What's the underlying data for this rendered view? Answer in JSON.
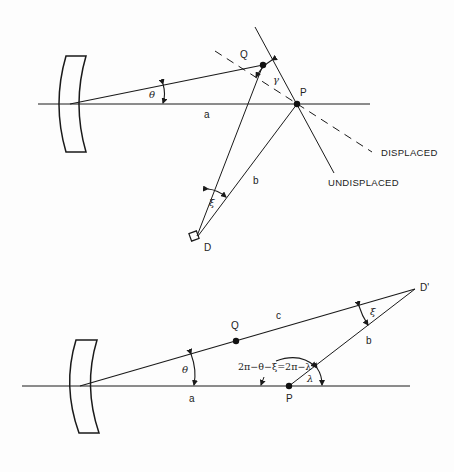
{
  "top_diagram": {
    "points": {
      "Q": "Q",
      "P": "P",
      "D": "D"
    },
    "segments": {
      "a": "a",
      "b": "b"
    },
    "angles": {
      "theta": "θ",
      "gamma": "γ",
      "xi": "ξ"
    },
    "line_labels": {
      "displaced": "DISPLACED",
      "undisplaced": "UNDISPLACED"
    }
  },
  "bottom_diagram": {
    "points": {
      "Q": "Q",
      "P": "P",
      "D_prime": "D'"
    },
    "segments": {
      "a": "a",
      "b": "b",
      "c": "c"
    },
    "angles": {
      "theta": "θ",
      "xi": "ξ",
      "lambda": "λ"
    },
    "formula": "2π−θ−ξ=2π−λ"
  },
  "colors": {
    "line": "#1a1a1a",
    "background": "#fdfdfd"
  }
}
